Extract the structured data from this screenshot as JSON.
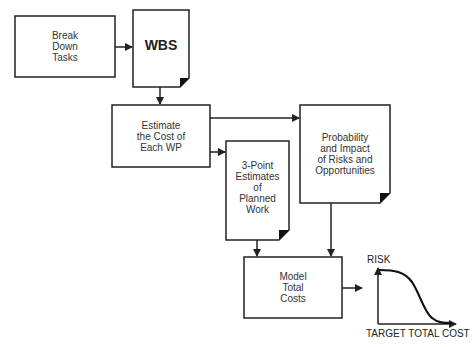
{
  "diagram": {
    "nodes": [
      {
        "id": "break-down",
        "shape": "rect",
        "label": "Break\nDown\nTasks"
      },
      {
        "id": "wbs",
        "shape": "document",
        "label": "WBS"
      },
      {
        "id": "estimate",
        "shape": "rect",
        "label": "Estimate\nthe Cost of\nEach WP"
      },
      {
        "id": "probability",
        "shape": "document",
        "label": "Probability\nand Impact\nof Risks and\nOpportunities"
      },
      {
        "id": "three-point",
        "shape": "document",
        "label": "3-Point\nEstimates\nof\nPlanned\nWork"
      },
      {
        "id": "model",
        "shape": "rect",
        "label": "Model\nTotal\nCosts"
      }
    ],
    "edges": [
      {
        "from": "break-down",
        "to": "wbs"
      },
      {
        "from": "wbs",
        "to": "estimate"
      },
      {
        "from": "estimate",
        "to": "probability"
      },
      {
        "from": "estimate",
        "to": "three-point"
      },
      {
        "from": "three-point",
        "to": "model"
      },
      {
        "from": "probability",
        "to": "model"
      },
      {
        "from": "model",
        "to": "risk-chart"
      }
    ],
    "risk_chart": {
      "y_label": "RISK",
      "x_label": "TARGET TOTAL COST",
      "curve": "s-curve decreasing"
    },
    "colors": {
      "stroke": "#222222",
      "background": "#ffffff",
      "fold": "#111111"
    }
  }
}
